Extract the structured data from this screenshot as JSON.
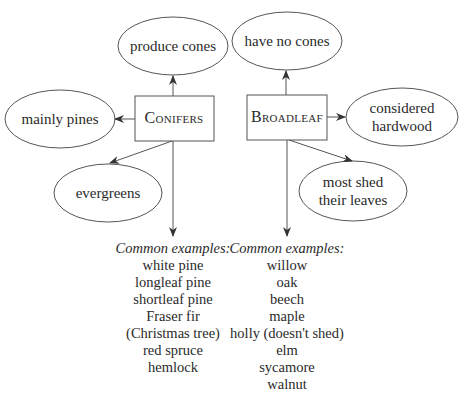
{
  "diagram": {
    "colors": {
      "stroke": "#555555",
      "text": "#2a2a2a",
      "background": "#ffffff"
    },
    "conifers": {
      "label": "Conifers",
      "traits": {
        "top": "produce cones",
        "left": "mainly pines",
        "bottom": "evergreens"
      },
      "examples_heading": "Common examples:",
      "examples": [
        "white pine",
        "longleaf pine",
        "shortleaf pine",
        "Fraser fir",
        "(Christmas tree)",
        "red spruce",
        "hemlock"
      ]
    },
    "broadleaf": {
      "label": "Broadleaf",
      "traits": {
        "top": "have no cones",
        "right_line1": "considered",
        "right_line2": "hardwood",
        "bottom_line1": "most shed",
        "bottom_line2": "their leaves"
      },
      "examples_heading": "Common examples:",
      "examples": [
        "willow",
        "oak",
        "beech",
        "maple",
        "holly (doesn't shed)",
        "elm",
        "sycamore",
        "walnut"
      ]
    }
  }
}
